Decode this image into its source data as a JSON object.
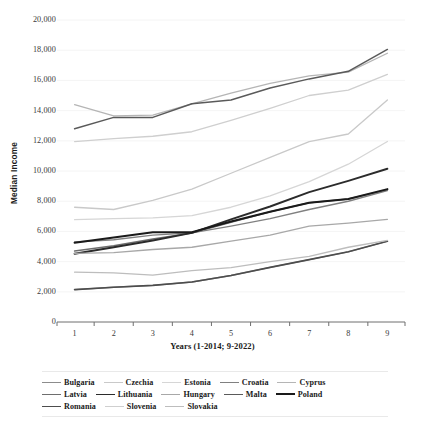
{
  "chart_data": {
    "type": "line",
    "title": "",
    "xlabel": "Years (1-2014; 9-2022)",
    "ylabel": "Median Income",
    "x": [
      1,
      2,
      3,
      4,
      5,
      6,
      7,
      8,
      9
    ],
    "xtick_labels": [
      "1",
      "2",
      "3",
      "4",
      "5",
      "6",
      "7",
      "8",
      "9"
    ],
    "ytick_labels": [
      "0",
      "2,000",
      "4,000",
      "6,000",
      "8,000",
      "10,000",
      "12,000",
      "14,000",
      "16,000",
      "18,000",
      "20,000"
    ],
    "ytick_values": [
      0,
      2000,
      4000,
      6000,
      8000,
      10000,
      12000,
      14000,
      16000,
      18000,
      20000
    ],
    "xlim": [
      0.55,
      9.45
    ],
    "ylim": [
      0,
      20000
    ],
    "grid": "horizontal-light",
    "legend_position": "bottom",
    "series": [
      {
        "name": "Bulgaria",
        "color": "#8c8c8c",
        "width": 1.3,
        "values": [
          2150,
          2300,
          2420,
          2650,
          3080,
          3620,
          4130,
          4650,
          5350
        ]
      },
      {
        "name": "Czechia",
        "color": "#c9c9c9",
        "width": 1.3,
        "values": [
          7600,
          7450,
          8050,
          8800,
          9850,
          10900,
          11950,
          12450,
          14700
        ]
      },
      {
        "name": "Estonia",
        "color": "#d6d6d6",
        "width": 1.3,
        "values": [
          6780,
          6850,
          6900,
          7050,
          7600,
          8350,
          9300,
          10450,
          11950
        ]
      },
      {
        "name": "Croatia",
        "color": "#808080",
        "width": 1.4,
        "values": [
          5300,
          5450,
          5750,
          5900,
          6350,
          6850,
          7450,
          8000,
          8700
        ]
      },
      {
        "name": "Cyprus",
        "color": "#b5b5b5",
        "width": 1.3,
        "values": [
          14400,
          13650,
          13700,
          14450,
          15150,
          15800,
          16300,
          16550,
          17800
        ]
      },
      {
        "name": "Latvia",
        "color": "#6e6e6e",
        "width": 1.5,
        "values": [
          4700,
          5050,
          5500,
          5900,
          6600,
          7300,
          7900,
          8150,
          8750
        ]
      },
      {
        "name": "Lithuania",
        "color": "#2b2b2b",
        "width": 1.9,
        "values": [
          4520,
          4950,
          5400,
          5900,
          6800,
          7650,
          8600,
          9350,
          10150
        ]
      },
      {
        "name": "Hungary",
        "color": "#a8a8a8",
        "width": 1.3,
        "values": [
          4550,
          4600,
          4800,
          4950,
          5350,
          5750,
          6350,
          6550,
          6800
        ]
      },
      {
        "name": "Malta",
        "color": "#5a5a5a",
        "width": 1.5,
        "values": [
          12800,
          13550,
          13550,
          14450,
          14700,
          15500,
          16100,
          16600,
          18050
        ]
      },
      {
        "name": "Poland",
        "color": "#1a1a1a",
        "width": 2.0,
        "values": [
          5250,
          5600,
          5950,
          5950,
          6650,
          7300,
          7900,
          8150,
          8800
        ]
      },
      {
        "name": "Romania",
        "color": "#4d4d4d",
        "width": 1.7,
        "values": [
          2150,
          2300,
          2420,
          2650,
          3080,
          3620,
          4130,
          4650,
          5350
        ]
      },
      {
        "name": "Slovenia",
        "color": "#cfcfcf",
        "width": 1.3,
        "values": [
          11950,
          12150,
          12300,
          12600,
          13350,
          14150,
          15000,
          15350,
          16400
        ]
      },
      {
        "name": "Slovakia",
        "color": "#bdbdbd",
        "width": 1.3,
        "values": [
          3300,
          3250,
          3100,
          3400,
          3600,
          4000,
          4350,
          4950,
          5400
        ]
      }
    ],
    "legend_rows": [
      [
        "Bulgaria",
        "Czechia",
        "Estonia",
        "Croatia",
        "Cyprus"
      ],
      [
        "Latvia",
        "Lithuania",
        "Hungary",
        "Malta",
        "Poland"
      ],
      [
        "Romania",
        "Slovenia",
        "Slovakia"
      ]
    ]
  }
}
